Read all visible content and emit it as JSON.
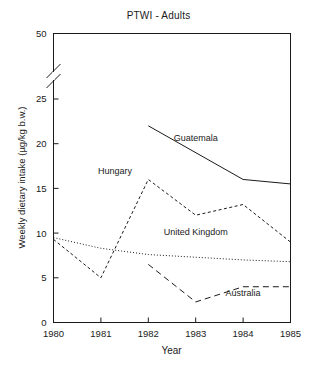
{
  "chart_data": {
    "type": "line",
    "title": "PTWI - Adults",
    "xlabel": "Year",
    "ylabel": "Weekly dietary intake (µg/kg b.w.)",
    "x": [
      1980,
      1981,
      1982,
      1983,
      1984,
      1985
    ],
    "xtick_labels": [
      "1980",
      "1981",
      "1982",
      "1983",
      "1984",
      "1985"
    ],
    "xlim": [
      1980,
      1985
    ],
    "ytick_labels": [
      "0",
      "5",
      "10",
      "15",
      "20",
      "25",
      "50"
    ],
    "ytick_values": [
      0,
      5,
      10,
      15,
      20,
      25,
      50
    ],
    "ylim": [
      0,
      27
    ],
    "axis_break": true,
    "axis_break_note": "y-axis broken between 25 and 50",
    "grid": false,
    "legend_position": "inline-labels",
    "series": [
      {
        "name": "Guatemala",
        "style": "solid",
        "label_x": 1983.0,
        "label_y": 20.3,
        "x": [
          1982,
          1984,
          1985
        ],
        "values": [
          22.0,
          16.0,
          15.5
        ]
      },
      {
        "name": "Hungary",
        "style": "dashed-fine",
        "label_x": 1981.3,
        "label_y": 16.6,
        "x": [
          1980,
          1981,
          1982,
          1983,
          1984,
          1985
        ],
        "values": [
          9.3,
          5.0,
          16.0,
          12.0,
          13.2,
          9.0
        ]
      },
      {
        "name": "United Kingdom",
        "style": "dotted",
        "label_x": 1983.0,
        "label_y": 9.8,
        "x": [
          1980,
          1981,
          1982,
          1983,
          1984,
          1985
        ],
        "values": [
          9.5,
          8.3,
          7.6,
          7.3,
          7.0,
          6.8
        ]
      },
      {
        "name": "Australia",
        "style": "dashed-coarse",
        "label_x": 1984.0,
        "label_y": 3.0,
        "x": [
          1982,
          1983,
          1984,
          1985
        ],
        "values": [
          6.5,
          2.3,
          4.0,
          4.0
        ]
      }
    ],
    "colors": {
      "axis": "#1a1a1a",
      "series_line": "#1a1a1a",
      "background": "#ffffff"
    }
  }
}
